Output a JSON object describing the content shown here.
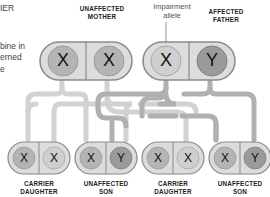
{
  "side_text": {
    "line1": "IER",
    "line2": "bine in",
    "line3": "erned",
    "line4": "e"
  },
  "annotation": {
    "line1": "Impairment",
    "line2": "allele"
  },
  "parents": {
    "mother": {
      "label_line1": "UNAFFECTED",
      "label_line2": "MOTHER",
      "left": "X",
      "right": "X"
    },
    "father": {
      "label_line1": "AFFECTED",
      "label_line2": "FATHER",
      "left": "X",
      "right": "Y"
    }
  },
  "children": [
    {
      "label_line1": "CARRIER",
      "label_line2": "DAUGHTER",
      "left": "X",
      "right": "X"
    },
    {
      "label_line1": "UNAFFECTED",
      "label_line2": "SON",
      "left": "X",
      "right": "Y"
    },
    {
      "label_line1": "CARRIER",
      "label_line2": "DAUGHTER",
      "left": "X",
      "right": "X"
    },
    {
      "label_line1": "UNAFFECTED",
      "label_line2": "SON",
      "left": "X",
      "right": "Y"
    }
  ],
  "colors": {
    "pill_fill": "#dcdcdc",
    "pill_stroke": "#8a8a8a",
    "circle_normal": "#b4b4b4",
    "circle_dark": "#9a9a9a",
    "circle_light": "#cfcfcf",
    "arrow_light": "#d2d2d2",
    "arrow_dark": "#b0b0b0"
  }
}
